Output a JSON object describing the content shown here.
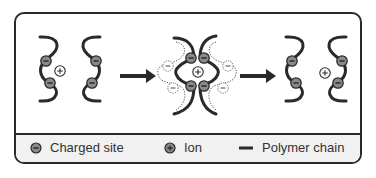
{
  "diagram": {
    "stages": [
      {
        "id": "before",
        "description": "Two polymer chains with charged sites, one ion between them"
      },
      {
        "id": "complex",
        "description": "Ion bound between charged sites of two chains with dissociated ions in a dotted hydration shell"
      },
      {
        "id": "after",
        "description": "Chains separated again, ion transferred to the other chain"
      }
    ],
    "arrows": 2
  },
  "legend": {
    "items": [
      {
        "symbol": "minus-circle",
        "label": "Charged site"
      },
      {
        "symbol": "plus-circle",
        "label": "Ion"
      },
      {
        "symbol": "line",
        "label": "Polymer chain"
      }
    ]
  },
  "colors": {
    "chain": "#2a2a2a",
    "charged_site_fill": "#8a8a8a",
    "ion_fill": "#ffffff",
    "legend_bg": "#f1f1f1",
    "border": "#2a2a2a"
  }
}
